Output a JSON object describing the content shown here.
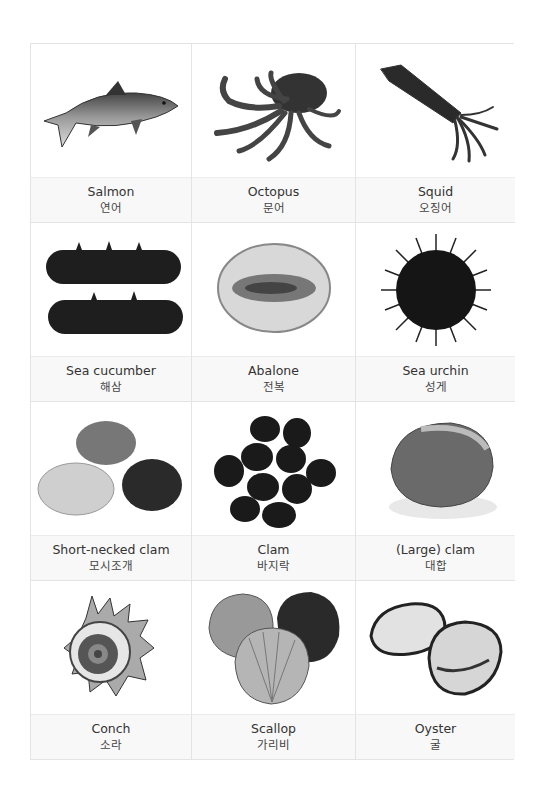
{
  "items": [
    {
      "en": "Salmon",
      "ko": "연어",
      "icon": "salmon-image"
    },
    {
      "en": "Octopus",
      "ko": "문어",
      "icon": "octopus-image"
    },
    {
      "en": "Squid",
      "ko": "오징어",
      "icon": "squid-image"
    },
    {
      "en": "Sea cucumber",
      "ko": "해삼",
      "icon": "sea-cucumber-image"
    },
    {
      "en": "Abalone",
      "ko": "전복",
      "icon": "abalone-image"
    },
    {
      "en": "Sea urchin",
      "ko": "성게",
      "icon": "sea-urchin-image"
    },
    {
      "en": "Short-necked clam",
      "ko": "모시조개",
      "icon": "short-necked-clam-image"
    },
    {
      "en": "Clam",
      "ko": "바지락",
      "icon": "clam-image"
    },
    {
      "en": "(Large) clam",
      "ko": "대합",
      "icon": "large-clam-image"
    },
    {
      "en": "Conch",
      "ko": "소라",
      "icon": "conch-image"
    },
    {
      "en": "Scallop",
      "ko": "가리비",
      "icon": "scallop-image"
    },
    {
      "en": "Oyster",
      "ko": "굴",
      "icon": "oyster-image"
    }
  ],
  "colors": {
    "border": "#e4e4e4",
    "label_bg": "#f8f8f8",
    "text": "#333333"
  }
}
